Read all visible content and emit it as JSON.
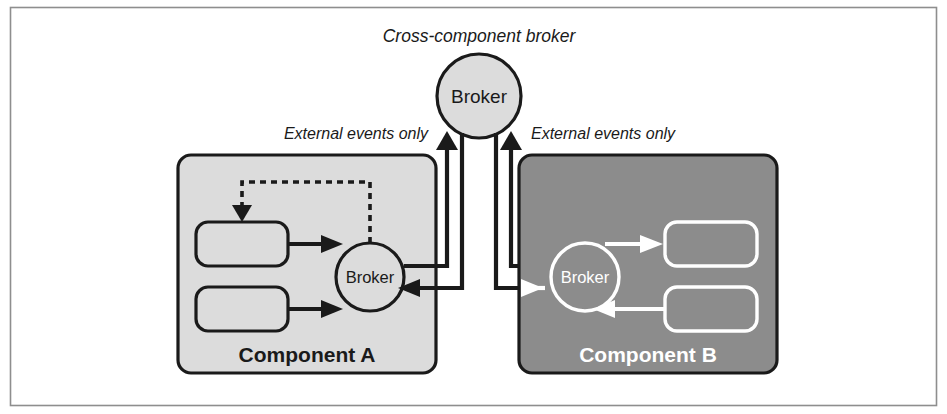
{
  "figure": {
    "kind": "architecture-diagram",
    "background": "#ffffff",
    "frame": {
      "stroke": "#8e8e8e"
    }
  },
  "labels": {
    "cross_component_broker": "Cross-component broker",
    "external_events_left": "External events only",
    "external_events_right": "External events only"
  },
  "top_broker": {
    "label": "Broker",
    "fill": "#dcdcdc",
    "stroke": "#1a1a1a"
  },
  "component_a": {
    "title": "Component A",
    "fill": "#dcdcdc",
    "stroke": "#1a1a1a",
    "text_color": "#1a1a1a",
    "broker": {
      "label": "Broker"
    },
    "nodes": [
      {
        "name": "event-processor-a1",
        "label": ""
      },
      {
        "name": "event-processor-a2",
        "label": ""
      }
    ],
    "edges": [
      {
        "from": "event-processor-a1",
        "to": "broker",
        "style": "solid"
      },
      {
        "from": "event-processor-a2",
        "to": "broker",
        "style": "solid"
      },
      {
        "from": "broker",
        "to": "event-processor-a1",
        "style": "dashed"
      }
    ]
  },
  "component_b": {
    "title": "Component B",
    "fill": "#8c8c8c",
    "stroke": "#1a1a1a",
    "text_color": "#ffffff",
    "broker": {
      "label": "Broker"
    },
    "nodes": [
      {
        "name": "event-processor-b1",
        "label": ""
      },
      {
        "name": "event-processor-b2",
        "label": ""
      }
    ],
    "edges": [
      {
        "from": "broker",
        "to": "event-processor-b1",
        "style": "solid"
      },
      {
        "from": "event-processor-b2",
        "to": "broker",
        "style": "solid"
      }
    ]
  },
  "cross_edges": [
    {
      "name": "a-broker-to-cross-broker",
      "from": "component-a-broker",
      "to": "cross-component-broker",
      "direction": "up",
      "color": "#1a1a1a"
    },
    {
      "name": "cross-broker-to-a-broker",
      "from": "cross-component-broker",
      "to": "component-a-broker",
      "direction": "down-left",
      "color": "#1a1a1a"
    },
    {
      "name": "b-broker-to-cross-broker",
      "from": "component-b-broker",
      "to": "cross-component-broker",
      "direction": "up",
      "color": "#1a1a1a"
    },
    {
      "name": "cross-broker-to-b-broker",
      "from": "cross-component-broker",
      "to": "component-b-broker",
      "direction": "down-right",
      "color": "#1a1a1a"
    }
  ]
}
